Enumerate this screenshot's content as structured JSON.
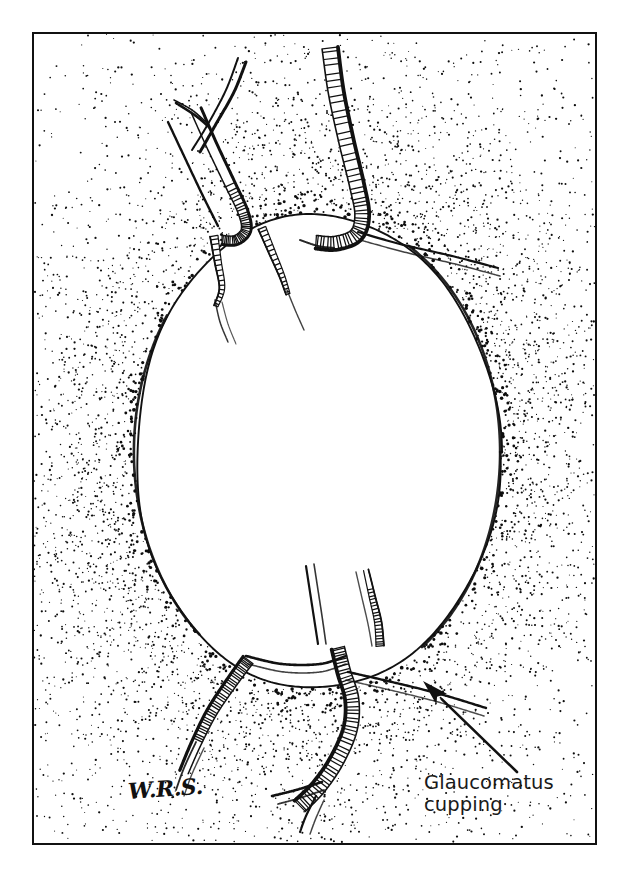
{
  "figure": {
    "kind": "medical-illustration",
    "technique": "pen-and-ink stipple drawing",
    "background_color": "#ffffff",
    "ink_color": "#111111",
    "frame": {
      "x": 32,
      "y": 32,
      "width": 565,
      "height": 813,
      "border_width": 2,
      "border_color": "#111111"
    }
  },
  "annotation": {
    "label_line_1": "Glaucomatus",
    "label_line_2": "cupping",
    "label_color": "#1a1a1a",
    "label_x": 424,
    "label_y": 772,
    "arrow": {
      "tail_x": 517,
      "tail_y": 772,
      "tip_x": 423,
      "tip_y": 681,
      "color": "#111111",
      "head_length": 26,
      "head_width": 15
    }
  },
  "signature": {
    "text": "W.R.S.",
    "x": 128,
    "y": 778,
    "color": "#111111"
  },
  "cup": {
    "center_x": 317,
    "center_y": 452,
    "radius_x": 182,
    "radius_y": 237,
    "rim_color": "#111111",
    "rim_width": 1.9,
    "interior_fill": "#ffffff",
    "interior_stipple_density": 0.16,
    "exterior_stipple_density": 1.0
  },
  "stipple": {
    "seed": 20240517,
    "dot_color": "#0d0d0d",
    "outer_band_count": 5200,
    "inner_count": 520,
    "min_radius": 0.5,
    "max_radius": 1.7,
    "falloff": 96
  },
  "vessels": [
    {
      "name": "superior-temporal-trunk",
      "position": "top-right",
      "style": "bayoneting",
      "hatched": true,
      "width": 13
    },
    {
      "name": "superior-nasal-branch",
      "position": "top-left",
      "style": "branching",
      "hatched": true,
      "width": 9
    },
    {
      "name": "superior-nasal-fork",
      "position": "top-left-upper",
      "style": "fork",
      "hatched": false,
      "width": 5
    },
    {
      "name": "cup-wall-vessel-left",
      "position": "upper-inner-left",
      "style": "diving",
      "hatched": true,
      "width": 6
    },
    {
      "name": "cup-wall-vessel-center",
      "position": "upper-inner-center",
      "style": "diving",
      "hatched": true,
      "width": 6
    },
    {
      "name": "inferior-temporal-trunk",
      "position": "bottom-right",
      "style": "bayoneting",
      "hatched": true,
      "width": 14
    },
    {
      "name": "inferior-nasal-branch",
      "position": "bottom-left",
      "style": "bayoneting",
      "hatched": true,
      "width": 11
    },
    {
      "name": "cup-wall-vessel-inferior-left",
      "position": "lower-inner-left",
      "style": "diving",
      "hatched": false,
      "width": 4
    },
    {
      "name": "cup-wall-vessel-inferior-right",
      "position": "lower-inner-right",
      "style": "diving",
      "hatched": true,
      "width": 5
    }
  ]
}
